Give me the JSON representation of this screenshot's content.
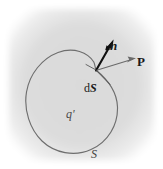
{
  "figure": {
    "canvas": {
      "width": 163,
      "height": 169
    },
    "background": {
      "page_color": "#ffffff",
      "panel_color": "#dcdcdc",
      "panel_edge_color": "#e8e8e8"
    },
    "colors": {
      "surface_curve": "#6e6e6e",
      "normal_vector": "#101010",
      "polarization_vector": "#6a6a6a",
      "element_line": "#4a4a4a",
      "label_text": "#1a1a1a",
      "interior_label_text": "#4a4a4a"
    },
    "labels": [
      {
        "id": "normal-vector-label",
        "text": "n",
        "style": "bold-italic",
        "meaning": "outward unit normal vector",
        "x": 110,
        "y": 39
      },
      {
        "id": "polarization-vector-label",
        "text": "P",
        "style": "bold-upright",
        "meaning": "polarization vector",
        "x": 137,
        "y": 55
      },
      {
        "id": "surface-element-label",
        "text": "dS",
        "text_parts": {
          "prefix": "d",
          "vector": "S"
        },
        "style": "upright-d-bold-italic-S",
        "meaning": "differential surface element vector",
        "x": 84,
        "y": 82
      },
      {
        "id": "bound-charge-label",
        "text": "q'",
        "style": "italic",
        "meaning": "bound charge enclosed by the surface",
        "x": 66,
        "y": 108
      },
      {
        "id": "surface-label",
        "text": "S",
        "style": "italic",
        "meaning": "closed surface",
        "x": 91,
        "y": 148
      }
    ],
    "geometry": {
      "panel": {
        "x": 8,
        "y": 8,
        "width": 147,
        "height": 153
      },
      "closed_curve_path": "M 96 70 C 108 78 118 92 118 108 C 118 126 108 143 91 150 C 74 157 54 153 42 141 C 30 129 24 110 27 92 C 30 74 42 58 58 52 C 74 46 88 52 94 62 C 95 65 95 68 96 70 Z",
      "vectors": [
        {
          "name": "normal",
          "from": [
            96,
            70
          ],
          "to": [
            113,
            41
          ],
          "thickness": 2.2,
          "arrowhead": "filled-solid",
          "color": "#101010"
        },
        {
          "name": "polarization",
          "from": [
            97,
            70
          ],
          "to": [
            136,
            58
          ],
          "thickness": 1.1,
          "arrowhead": "open-thin",
          "color": "#6a6a6a"
        },
        {
          "name": "surface-element-leader",
          "from": [
            96,
            70
          ],
          "to": [
            110,
            84
          ],
          "thickness": 0.9,
          "arrowhead": "none",
          "color": "#4a4a4a"
        }
      ]
    }
  }
}
